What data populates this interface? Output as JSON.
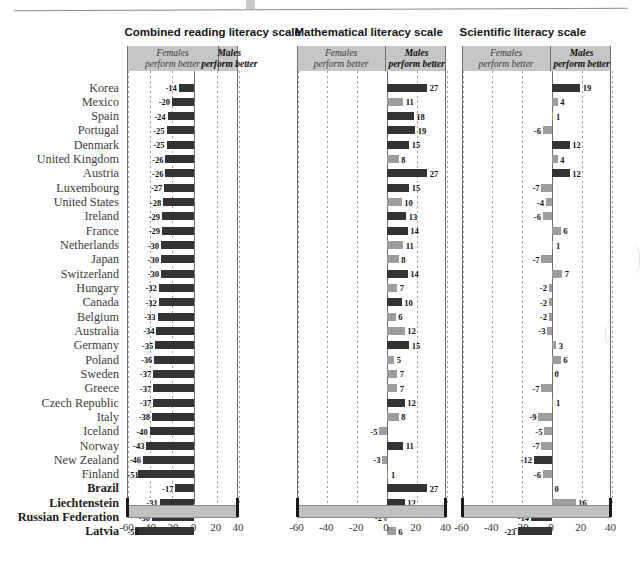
{
  "figure": {
    "panel_titles": [
      "Combined reading literacy scale",
      "Mathematical literacy scale",
      "Scientific literacy scale"
    ],
    "header_left": {
      "line1": "Females",
      "line2": "perform better"
    },
    "header_right": {
      "line1": "Males",
      "line2": "perform better"
    },
    "axis_ticks": [
      "-60",
      "-40",
      "-20",
      "0",
      "20",
      "40"
    ],
    "colors": {
      "significant": "#333333",
      "not_significant": "#9d9d9d",
      "header_band": "#c6c6c6",
      "axis_bar": "#c0c0c0"
    }
  },
  "chart_data": {
    "type": "bar",
    "orientation": "horizontal",
    "xlabel": "",
    "ylabel": "",
    "xlim": [
      -60,
      40
    ],
    "xticks": [
      -60,
      -40,
      -20,
      0,
      20,
      40
    ],
    "grid": true,
    "legend": [
      "Females perform better",
      "Males perform better"
    ],
    "categories": [
      "Korea",
      "Mexico",
      "Spain",
      "Portugal",
      "Denmark",
      "United Kingdom",
      "Austria",
      "Luxembourg",
      "United States",
      "Ireland",
      "France",
      "Netherlands",
      "Japan",
      "Switzerland",
      "Hungary",
      "Canada",
      "Belgium",
      "Australia",
      "Germany",
      "Poland",
      "Sweden",
      "Greece",
      "Czech Republic",
      "Italy",
      "Iceland",
      "Norway",
      "New Zealand",
      "Finland",
      "Brazil",
      "Liechtenstein",
      "Russian Federation",
      "Latvia"
    ],
    "bold_categories": [
      "Brazil",
      "Liechtenstein",
      "Russian Federation",
      "Latvia"
    ],
    "series": [
      {
        "name": "Combined reading literacy scale",
        "values": [
          -14,
          -20,
          -24,
          -25,
          -25,
          -26,
          -26,
          -27,
          -28,
          -29,
          -29,
          -30,
          -30,
          -30,
          -32,
          -32,
          -33,
          -34,
          -35,
          -36,
          -37,
          -37,
          -37,
          -38,
          -40,
          -43,
          -46,
          -51,
          -17,
          -31,
          -38,
          -53
        ],
        "significant": [
          true,
          true,
          true,
          true,
          true,
          true,
          true,
          true,
          true,
          true,
          true,
          true,
          true,
          true,
          true,
          true,
          true,
          true,
          true,
          true,
          true,
          true,
          true,
          true,
          true,
          true,
          true,
          true,
          true,
          true,
          true,
          true
        ]
      },
      {
        "name": "Mathematical literacy scale",
        "values": [
          27,
          11,
          18,
          19,
          15,
          8,
          27,
          15,
          10,
          13,
          14,
          11,
          8,
          14,
          7,
          10,
          6,
          12,
          15,
          5,
          7,
          7,
          12,
          8,
          -5,
          11,
          -3,
          1,
          27,
          12,
          -2,
          6
        ],
        "significant": [
          true,
          false,
          true,
          true,
          true,
          false,
          true,
          true,
          false,
          true,
          true,
          false,
          false,
          true,
          false,
          true,
          false,
          false,
          true,
          false,
          false,
          false,
          true,
          false,
          false,
          true,
          false,
          false,
          true,
          true,
          false,
          false
        ]
      },
      {
        "name": "Scientific literacy scale",
        "values": [
          19,
          4,
          1,
          -6,
          12,
          4,
          12,
          -7,
          -4,
          -6,
          6,
          1,
          -7,
          7,
          -2,
          -2,
          -2,
          -3,
          3,
          6,
          0,
          -7,
          1,
          -9,
          -5,
          -7,
          -12,
          -6,
          0,
          16,
          -14,
          -23
        ],
        "significant": [
          true,
          false,
          false,
          false,
          true,
          false,
          true,
          false,
          false,
          false,
          false,
          false,
          false,
          false,
          false,
          false,
          false,
          false,
          false,
          false,
          false,
          false,
          false,
          false,
          false,
          false,
          true,
          false,
          false,
          false,
          true,
          true
        ]
      }
    ]
  }
}
